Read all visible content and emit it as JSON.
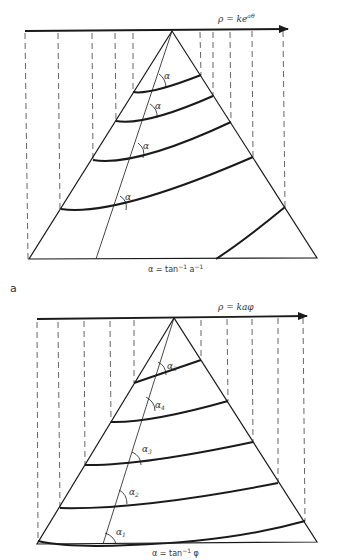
{
  "figure": {
    "panel_a": {
      "panel_label": "a",
      "axis_label": "ρ = ke^{aθ}",
      "axis_label_main": "ρ = ke",
      "axis_label_sup": "aθ",
      "caption_main": "α = tan",
      "caption_sup1": "−1",
      "caption_mid": " a",
      "caption_sup2": "−1",
      "angle_labels": [
        "α",
        "α",
        "α",
        "α"
      ]
    },
    "panel_b": {
      "axis_label": "ρ = kaφ",
      "caption_main": "α = tan",
      "caption_sup": "−1",
      "caption_end": " φ",
      "angle_labels": [
        {
          "base": "α",
          "sub": "5"
        },
        {
          "base": "α",
          "sub": "4"
        },
        {
          "base": "α",
          "sub": "3"
        },
        {
          "base": "α",
          "sub": "2"
        },
        {
          "base": "α",
          "sub": "1"
        }
      ]
    },
    "colors": {
      "ink": "#1a1a1a",
      "dash": "#555555"
    }
  }
}
